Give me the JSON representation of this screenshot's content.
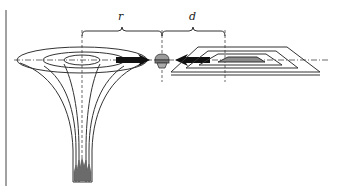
{
  "diagram": {
    "labels": {
      "r": "r",
      "d": "d"
    },
    "components": [
      {
        "name": "heating-funnel",
        "description": "field-line funnel with flame at base"
      },
      {
        "name": "fastener",
        "description": "small mushroom-shaped object between arrows"
      },
      {
        "name": "planar-coil",
        "description": "flat rectangular coil in perspective"
      }
    ],
    "colors": {
      "stroke": "#333333",
      "arrow": "#111111",
      "flame": "#6b6b6b",
      "background": "#ffffff"
    }
  }
}
